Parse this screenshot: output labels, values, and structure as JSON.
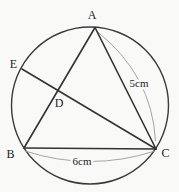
{
  "figure": {
    "type": "geometry-diagram",
    "colors": {
      "background": "#f9f9f7",
      "ink": "#333333",
      "leader": "#9a9a9a",
      "text": "#1c1c1c"
    },
    "points": {
      "A": {
        "label": "A"
      },
      "B": {
        "label": "B"
      },
      "C": {
        "label": "C"
      },
      "D": {
        "label": "D"
      },
      "E": {
        "label": "E"
      }
    },
    "measurements": {
      "AC": {
        "text": "5cm"
      },
      "BC": {
        "text": "6cm"
      }
    }
  }
}
